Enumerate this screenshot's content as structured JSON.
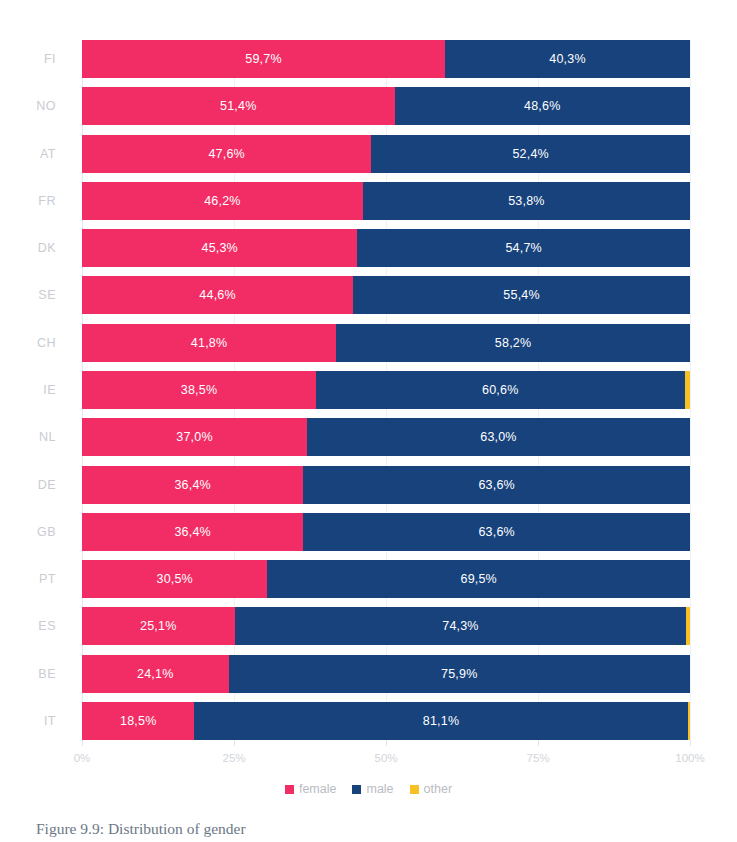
{
  "chart_data": {
    "type": "bar",
    "subtype": "horizontal-stacked-100",
    "title": "",
    "xlabel": "",
    "ylabel": "",
    "xlim": [
      0,
      100
    ],
    "grid": true,
    "legend_position": "bottom",
    "categories": [
      "FI",
      "NO",
      "AT",
      "FR",
      "DK",
      "SE",
      "CH",
      "IE",
      "NL",
      "DE",
      "GB",
      "PT",
      "ES",
      "BE",
      "IT"
    ],
    "series": [
      {
        "name": "female",
        "color": "#F22D66",
        "values": [
          59.7,
          51.4,
          47.6,
          46.2,
          45.3,
          44.6,
          41.8,
          38.5,
          37.0,
          36.4,
          36.4,
          30.5,
          25.1,
          24.1,
          18.5
        ],
        "labels": [
          "59,7%",
          "51,4%",
          "47,6%",
          "46,2%",
          "45,3%",
          "44,6%",
          "41,8%",
          "38,5%",
          "37,0%",
          "36,4%",
          "36,4%",
          "30,5%",
          "25,1%",
          "24,1%",
          "18,5%"
        ]
      },
      {
        "name": "male",
        "color": "#17427C",
        "values": [
          40.3,
          48.6,
          52.4,
          53.8,
          54.7,
          55.4,
          58.2,
          60.6,
          63.0,
          63.6,
          63.6,
          69.5,
          74.3,
          75.9,
          81.1
        ],
        "labels": [
          "40,3%",
          "48,6%",
          "52,4%",
          "53,8%",
          "54,7%",
          "55,4%",
          "58,2%",
          "60,6%",
          "63,0%",
          "63,6%",
          "63,6%",
          "69,5%",
          "74,3%",
          "75,9%",
          "81,1%"
        ]
      },
      {
        "name": "other",
        "color": "#F7C024",
        "values": [
          0.0,
          0.0,
          0.0,
          0.0,
          0.0,
          0.0,
          0.0,
          0.9,
          0.0,
          0.0,
          0.0,
          0.0,
          0.6,
          0.0,
          0.4
        ],
        "labels": [
          "",
          "",
          "",
          "",
          "",
          "",
          "",
          "",
          "",
          "",
          "",
          "",
          "",
          "",
          ""
        ]
      }
    ],
    "x_ticks": [
      {
        "value": 0,
        "label": "0%"
      },
      {
        "value": 25,
        "label": "25%"
      },
      {
        "value": 50,
        "label": "50%"
      },
      {
        "value": 75,
        "label": "75%"
      },
      {
        "value": 100,
        "label": "100%"
      }
    ],
    "legend": [
      {
        "label": "female",
        "color": "#F22D66"
      },
      {
        "label": "male",
        "color": "#17427C"
      },
      {
        "label": "other",
        "color": "#F7C024"
      }
    ]
  },
  "caption": "Figure 9.9: Distribution of gender",
  "colors": {
    "female": "#F22D66",
    "male": "#17427C",
    "other": "#F7C024",
    "axis": "#e4e7ec",
    "tick_text": "#d2d5da",
    "grid": "#eef1f5"
  }
}
